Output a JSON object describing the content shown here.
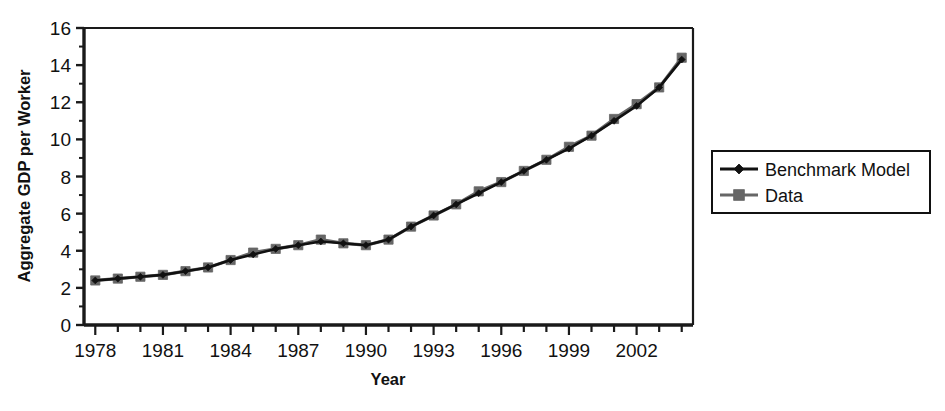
{
  "chart_data": {
    "type": "line",
    "title": "",
    "xlabel": "Year",
    "ylabel": "Aggregate GDP per Worker",
    "xlim": [
      1977.5,
      2004.5
    ],
    "ylim": [
      0,
      16
    ],
    "yticks": [
      0,
      2,
      4,
      6,
      8,
      10,
      12,
      14,
      16
    ],
    "ytick_labels": [
      "0",
      "2",
      "4",
      "6",
      "8",
      "10",
      "12",
      "14",
      "16"
    ],
    "xticks": [
      1978,
      1981,
      1984,
      1987,
      1990,
      1993,
      1996,
      1999,
      2002
    ],
    "xtick_labels": [
      "1978",
      "1981",
      "1984",
      "1987",
      "1990",
      "1993",
      "1996",
      "1999",
      "2002"
    ],
    "x_minor_ticks": [
      1978,
      1979,
      1980,
      1981,
      1982,
      1983,
      1984,
      1985,
      1986,
      1987,
      1988,
      1989,
      1990,
      1991,
      1992,
      1993,
      1994,
      1995,
      1996,
      1997,
      1998,
      1999,
      2000,
      2001,
      2002,
      2003,
      2004
    ],
    "y_minor_step": 1,
    "grid": false,
    "legend_position": "right-outside",
    "x": [
      1978,
      1979,
      1980,
      1981,
      1982,
      1983,
      1984,
      1985,
      1986,
      1987,
      1988,
      1989,
      1990,
      1991,
      1992,
      1993,
      1994,
      1995,
      1996,
      1997,
      1998,
      1999,
      2000,
      2001,
      2002,
      2003,
      2004
    ],
    "series": [
      {
        "name": "Benchmark Model",
        "color": "#111111",
        "marker": "diamond",
        "values": [
          2.4,
          2.5,
          2.6,
          2.7,
          2.9,
          3.1,
          3.5,
          3.8,
          4.1,
          4.3,
          4.5,
          4.4,
          4.3,
          4.6,
          5.3,
          5.9,
          6.5,
          7.1,
          7.7,
          8.3,
          8.9,
          9.5,
          10.2,
          11.0,
          11.8,
          12.8,
          14.3
        ]
      },
      {
        "name": "Data",
        "color": "#666666",
        "marker": "square",
        "values": [
          2.4,
          2.5,
          2.6,
          2.7,
          2.9,
          3.1,
          3.5,
          3.9,
          4.1,
          4.3,
          4.6,
          4.4,
          4.3,
          4.6,
          5.3,
          5.9,
          6.5,
          7.2,
          7.7,
          8.3,
          8.9,
          9.6,
          10.2,
          11.1,
          11.9,
          12.8,
          14.4
        ]
      }
    ]
  },
  "legend": {
    "items": [
      {
        "label": "Benchmark Model",
        "marker": "diamond-marker",
        "color": "#111111"
      },
      {
        "label": "Data",
        "marker": "square-marker",
        "color": "#666666"
      }
    ]
  },
  "colors": {
    "benchmark": "#111111",
    "data": "#666666",
    "axis": "#1a1a1a",
    "background": "#ffffff"
  }
}
